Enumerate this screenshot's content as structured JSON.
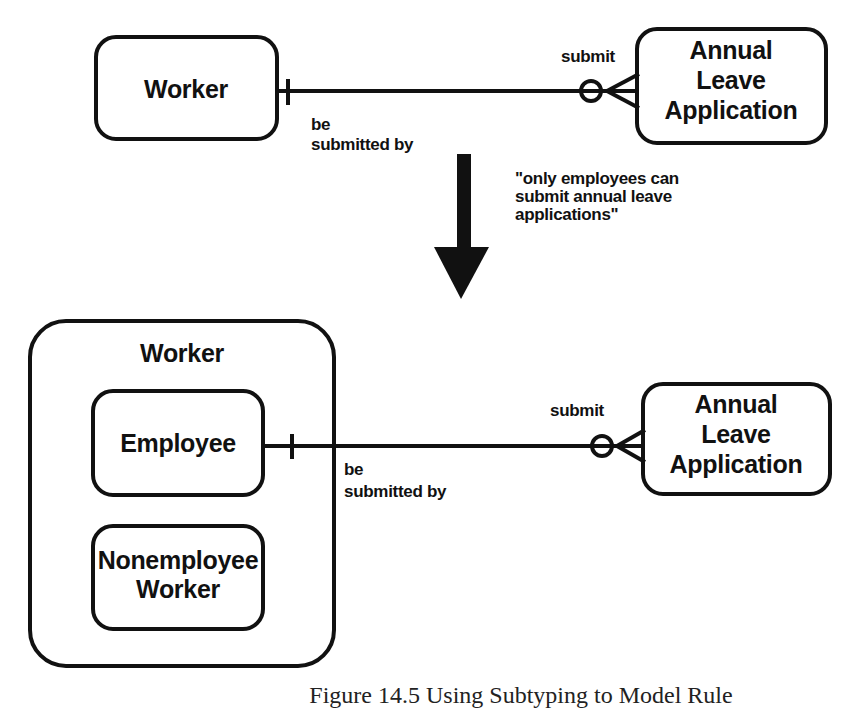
{
  "diagram": {
    "top": {
      "entities": [
        {
          "id": "worker",
          "label_lines": [
            "Worker"
          ]
        },
        {
          "id": "annual-leave-application",
          "label_lines": [
            "Annual",
            "Leave",
            "Application"
          ]
        }
      ],
      "relationship": {
        "from": "worker",
        "to": "annual-leave-application",
        "from_end": "exactly-one",
        "to_end": "zero-or-many",
        "label_near_to": "submit",
        "label_near_from_lines": [
          "be",
          "submitted by"
        ]
      }
    },
    "transformation": {
      "arrow": "down-arrow",
      "note_lines": [
        "\"only employees can",
        "submit annual leave",
        "applications\""
      ]
    },
    "bottom": {
      "supertype": {
        "id": "worker",
        "label": "Worker"
      },
      "subtypes": [
        {
          "id": "employee",
          "label_lines": [
            "Employee"
          ]
        },
        {
          "id": "nonemployee-worker",
          "label_lines": [
            "Nonemployee",
            "Worker"
          ]
        }
      ],
      "entities": [
        {
          "id": "annual-leave-application",
          "label_lines": [
            "Annual",
            "Leave",
            "Application"
          ]
        }
      ],
      "relationship": {
        "from": "employee",
        "to": "annual-leave-application",
        "from_end": "exactly-one",
        "to_end": "zero-or-many",
        "label_near_to": "submit",
        "label_near_from_lines": [
          "be",
          "submitted by"
        ]
      }
    },
    "caption": "Figure 14.5 Using Subtyping to Model Rule"
  },
  "colors": {
    "ink": "#111111",
    "background": "#ffffff"
  }
}
